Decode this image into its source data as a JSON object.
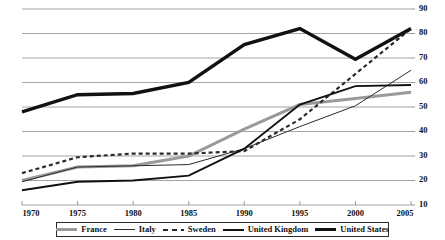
{
  "chart_data": {
    "type": "line",
    "title": "",
    "subtitle": "",
    "xlabel": "",
    "ylabel": "",
    "x": [
      1970,
      1975,
      1980,
      1985,
      1990,
      1995,
      2000,
      2005
    ],
    "xtick_labels": [
      "1970",
      "1975",
      "1980",
      "1985",
      "1990",
      "1995",
      "2000",
      "2005"
    ],
    "ytick_labels": [
      "10",
      "20",
      "30",
      "40",
      "50",
      "60",
      "70",
      "80",
      "90"
    ],
    "yticks": [
      10,
      20,
      30,
      40,
      50,
      60,
      70,
      80,
      90
    ],
    "xlim": [
      1970,
      2005
    ],
    "ylim": [
      10,
      90
    ],
    "grid": "horizontal",
    "legend_position": "bottom",
    "series": [
      {
        "name": "France",
        "style": "solid-thick-gray",
        "color": "#9a9a9a",
        "width": 3.0,
        "dash": "none",
        "values": [
          20.0,
          25.5,
          26.0,
          30.0,
          41.0,
          51.0,
          53.5,
          56.0
        ]
      },
      {
        "name": "Italy",
        "style": "solid-thin",
        "color": "#2b2b2b",
        "width": 1.0,
        "dash": "none",
        "values": [
          19.5,
          25.5,
          26.0,
          26.5,
          33.0,
          42.0,
          50.5,
          65.0
        ]
      },
      {
        "name": "Sweden",
        "style": "dashed",
        "color": "#2b2b2b",
        "width": 2.2,
        "dash": "4,3",
        "values": [
          23.0,
          29.5,
          31.0,
          31.0,
          32.0,
          45.0,
          63.5,
          82.0
        ]
      },
      {
        "name": "United Kingdom",
        "style": "solid-medium",
        "color": "#111111",
        "width": 1.9,
        "dash": "none",
        "values": [
          16.0,
          19.5,
          20.0,
          22.0,
          33.0,
          51.0,
          58.5,
          59.0
        ]
      },
      {
        "name": "United States",
        "style": "solid-extrathick",
        "color": "#111111",
        "width": 3.4,
        "dash": "none",
        "values": [
          48.0,
          55.0,
          55.5,
          60.0,
          75.5,
          82.0,
          69.5,
          82.0
        ]
      }
    ]
  },
  "legend": {
    "entries": [
      {
        "label": "France"
      },
      {
        "label": "Italy"
      },
      {
        "label": "Sweden"
      },
      {
        "label": "United Kingdom"
      },
      {
        "label": "United States"
      }
    ]
  },
  "colors": {
    "grid": "#8e8e8e",
    "axis": "#8e8e8e",
    "text": "#111111",
    "background": "#ffffff"
  }
}
